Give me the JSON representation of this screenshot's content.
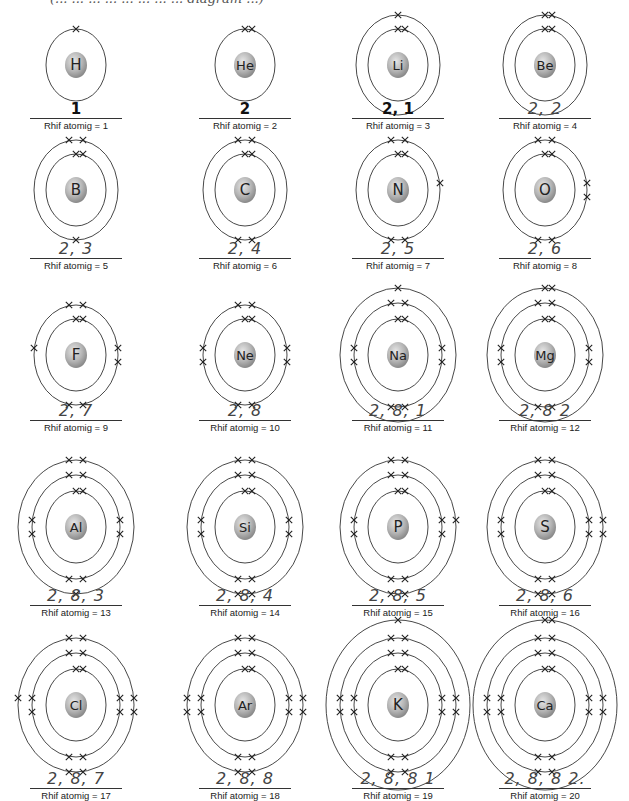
{
  "header": {
    "partial_text": "(... ... ... ... ... ... ... ... diagram ...)"
  },
  "label_prefix": "Rhif atomig = ",
  "colors": {
    "nucleus_light": "#e6e6e6",
    "nucleus_dark": "#8a8a8a",
    "line": "#333333",
    "text": "#222222"
  },
  "atoms": [
    {
      "symbol": "H",
      "z": "Rhif atomig = 1",
      "config": "1",
      "shells": [
        1
      ]
    },
    {
      "symbol": "He",
      "z": "Rhif atomig = 2",
      "config": "2",
      "shells": [
        2
      ]
    },
    {
      "symbol": "Li",
      "z": "Rhif atomig = 3",
      "config": "2, 1",
      "shells": [
        2,
        1
      ]
    },
    {
      "symbol": "Be",
      "z": "Rhif atomig = 4",
      "config": "2, 2",
      "shells": [
        2,
        2
      ]
    },
    {
      "symbol": "B",
      "z": "Rhif atomig = 5",
      "config": "2, 3",
      "shells": [
        2,
        3
      ]
    },
    {
      "symbol": "C",
      "z": "Rhif atomig = 6",
      "config": "2, 4",
      "shells": [
        2,
        4
      ]
    },
    {
      "symbol": "N",
      "z": "Rhif atomig = 7",
      "config": "2, 5",
      "shells": [
        2,
        5
      ]
    },
    {
      "symbol": "O",
      "z": "Rhif atomig = 8",
      "config": "2, 6",
      "shells": [
        2,
        6
      ]
    },
    {
      "symbol": "F",
      "z": "Rhif atomig = 9",
      "config": "2, 7",
      "shells": [
        2,
        7
      ]
    },
    {
      "symbol": "Ne",
      "z": "Rhif atomig = 10",
      "config": "2, 8",
      "shells": [
        2,
        8
      ]
    },
    {
      "symbol": "Na",
      "z": "Rhif atomig = 11",
      "config": "2, 8, 1",
      "shells": [
        2,
        8,
        1
      ]
    },
    {
      "symbol": "Mg",
      "z": "Rhif atomig = 12",
      "config": "2, 8 2",
      "shells": [
        2,
        8,
        2
      ]
    },
    {
      "symbol": "Al",
      "z": "Rhif atomig = 13",
      "config": "2, 8, 3",
      "shells": [
        2,
        8,
        3
      ]
    },
    {
      "symbol": "Si",
      "z": "Rhif atomig = 14",
      "config": "2, 8, 4",
      "shells": [
        2,
        8,
        4
      ]
    },
    {
      "symbol": "P",
      "z": "Rhif atomig = 15",
      "config": "2, 8, 5",
      "shells": [
        2,
        8,
        5
      ]
    },
    {
      "symbol": "S",
      "z": "Rhif atomig = 16",
      "config": "2, 8, 6",
      "shells": [
        2,
        8,
        6
      ]
    },
    {
      "symbol": "Cl",
      "z": "Rhif atomig = 17",
      "config": "2, 8, 7",
      "shells": [
        2,
        8,
        7
      ]
    },
    {
      "symbol": "Ar",
      "z": "Rhif atomig = 18",
      "config": "2, 8, 8",
      "shells": [
        2,
        8,
        8
      ]
    },
    {
      "symbol": "K",
      "z": "Rhif atomig = 19",
      "config": "2, 8, 8 1",
      "shells": [
        2,
        8,
        8,
        1
      ]
    },
    {
      "symbol": "Ca",
      "z": "Rhif atomig = 20",
      "config": "2, 8, 8 2.",
      "shells": [
        2,
        8,
        8,
        2
      ]
    }
  ]
}
